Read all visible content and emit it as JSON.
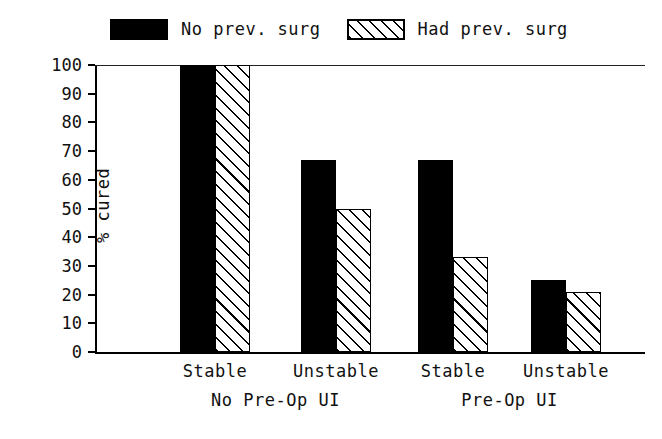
{
  "chart_data": {
    "type": "bar",
    "title": "",
    "xlabel": "",
    "ylabel": "% cured",
    "ylim": [
      0,
      100
    ],
    "yticks": [
      0,
      10,
      20,
      30,
      40,
      50,
      60,
      70,
      80,
      90,
      100
    ],
    "grid": false,
    "legend_position": "top",
    "categories": [
      "Stable",
      "Unstable",
      "Stable",
      "Unstable"
    ],
    "groups": [
      {
        "label": "No Pre-Op UI",
        "categories": [
          "Stable",
          "Unstable"
        ]
      },
      {
        "label": "Pre-Op UI",
        "categories": [
          "Stable",
          "Unstable"
        ]
      }
    ],
    "series": [
      {
        "name": "No prev. surg",
        "fill": "solid",
        "color": "#000000",
        "values": [
          100,
          67,
          67,
          25
        ]
      },
      {
        "name": "Had prev. surg",
        "fill": "hatch",
        "color": "#000000",
        "values": [
          100,
          50,
          33,
          21
        ]
      }
    ],
    "annotations": {
      "top_rule_value": 100
    }
  },
  "legend": {
    "entries": [
      {
        "label": "No prev. surg",
        "fill": "solid"
      },
      {
        "label": "Had prev. surg",
        "fill": "hatch"
      }
    ]
  },
  "axes": {
    "y": {
      "title": "% cured",
      "ticks": [
        "100",
        "90",
        "80",
        "70",
        "60",
        "50",
        "40",
        "30",
        "20",
        "10",
        "0"
      ]
    },
    "x": {
      "category_labels": [
        "Stable",
        "Unstable",
        "Stable",
        "Unstable"
      ],
      "group_labels": [
        "No Pre-Op UI",
        "Pre-Op UI"
      ]
    }
  },
  "caption": {
    "text": ""
  }
}
